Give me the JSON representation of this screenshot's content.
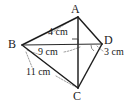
{
  "figure": {
    "kind": "geometry-quadrilateral",
    "background_color": "#ffffff",
    "line_color": "#1d1d1d",
    "leader_color": "#8e8e8e",
    "vertices": [
      {
        "id": "A",
        "label": "A",
        "x": 78,
        "y": 17
      },
      {
        "id": "B",
        "label": "B",
        "x": 22,
        "y": 45
      },
      {
        "id": "C",
        "label": "C",
        "x": 78,
        "y": 88
      },
      {
        "id": "D",
        "label": "D",
        "x": 102,
        "y": 44
      }
    ],
    "edges": [
      {
        "id": "AB",
        "from": "A",
        "to": "B",
        "style": "solid"
      },
      {
        "id": "AD",
        "from": "A",
        "to": "D",
        "style": "solid"
      },
      {
        "id": "BC",
        "from": "B",
        "to": "C",
        "style": "solid"
      },
      {
        "id": "DC",
        "from": "D",
        "to": "C",
        "style": "solid"
      },
      {
        "id": "AC",
        "from": "A",
        "to": "C",
        "style": "solid"
      },
      {
        "id": "BD",
        "from": "B",
        "to": "D",
        "style": "solid"
      }
    ],
    "measurements": [
      {
        "id": "ab",
        "segment": "AB",
        "value": 4,
        "unit": "cm",
        "text": "4 cm"
      },
      {
        "id": "bd",
        "segment": "BD",
        "value": 9,
        "unit": "cm",
        "text": "9 cm"
      },
      {
        "id": "bc",
        "segment": "BC",
        "value": 11,
        "unit": "cm",
        "text": "11 cm"
      },
      {
        "id": "dc",
        "segment": "DC",
        "value": 3,
        "unit": "cm",
        "text": "3 cm"
      }
    ],
    "markers": [
      {
        "id": "right-angle-at-intersection",
        "type": "right-angle",
        "at": "intersection of AC and BD"
      },
      {
        "id": "angle-arc-at-D",
        "type": "angle-arc",
        "at": "D"
      }
    ]
  }
}
